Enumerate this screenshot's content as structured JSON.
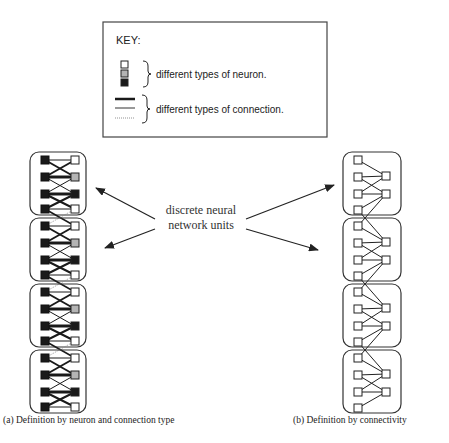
{
  "key": {
    "title": "KEY:",
    "neuron_label": "different types of neuron.",
    "connection_label": "different types of connection.",
    "neuron_types": [
      {
        "name": "white",
        "color": "#ffffff"
      },
      {
        "name": "grey",
        "color": "#b4b4b4"
      },
      {
        "name": "black",
        "color": "#1a1a1a"
      }
    ],
    "connection_types": [
      "thick",
      "thin",
      "dotted"
    ]
  },
  "center_label": {
    "line1": "discrete neural",
    "line2": "network units"
  },
  "diagram_a": {
    "caption": "(a) Definition by neuron and connection type",
    "unit_count": 4,
    "right_column_colors": [
      "#ffffff",
      "#b4b4b4",
      "#1a1a1a",
      "#ffffff"
    ]
  },
  "diagram_b": {
    "caption": "(b) Definition by connectivity",
    "unit_count": 4
  }
}
